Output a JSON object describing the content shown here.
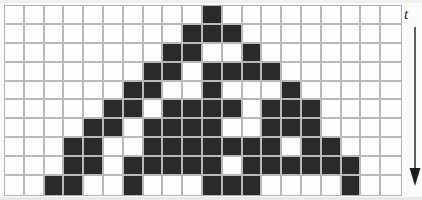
{
  "figure": {
    "kind": "cellular-automaton-spacetime-diagram",
    "background_color": "#fbfbfb",
    "grid_line_color": "#b9b9b9",
    "alive_cell_color": "#2a2a2a",
    "dead_cell_color": "#fdfdfd"
  },
  "axis": {
    "time_label": "t",
    "arrow_icon": "down-arrow-icon",
    "direction": "downward"
  },
  "chart_data": {
    "type": "heatmap",
    "title": "",
    "xlabel": "",
    "ylabel": "t",
    "columns": 20,
    "rows": 10,
    "legend": [
      {
        "value": 1,
        "label": "alive",
        "color": "#2a2a2a"
      },
      {
        "value": 0,
        "label": "dead",
        "color": "#fdfdfd"
      }
    ],
    "row_labels": [
      "0",
      "1",
      "2",
      "3",
      "4",
      "5",
      "6",
      "7",
      "8",
      "9"
    ],
    "column_labels": [
      "0",
      "1",
      "2",
      "3",
      "4",
      "5",
      "6",
      "7",
      "8",
      "9",
      "10",
      "11",
      "12",
      "13",
      "14",
      "15",
      "16",
      "17",
      "18",
      "19"
    ],
    "matrix": [
      [
        0,
        0,
        0,
        0,
        0,
        0,
        0,
        0,
        0,
        0,
        1,
        0,
        0,
        0,
        0,
        0,
        0,
        0,
        0,
        0
      ],
      [
        0,
        0,
        0,
        0,
        0,
        0,
        0,
        0,
        0,
        1,
        1,
        1,
        0,
        0,
        0,
        0,
        0,
        0,
        0,
        0
      ],
      [
        0,
        0,
        0,
        0,
        0,
        0,
        0,
        0,
        1,
        1,
        0,
        0,
        1,
        0,
        0,
        0,
        0,
        0,
        0,
        0
      ],
      [
        0,
        0,
        0,
        0,
        0,
        0,
        0,
        1,
        1,
        0,
        1,
        1,
        1,
        1,
        0,
        0,
        0,
        0,
        0,
        0
      ],
      [
        0,
        0,
        0,
        0,
        0,
        0,
        1,
        1,
        0,
        0,
        1,
        0,
        0,
        0,
        1,
        0,
        0,
        0,
        0,
        0
      ],
      [
        0,
        0,
        0,
        0,
        0,
        1,
        1,
        0,
        1,
        1,
        1,
        1,
        0,
        1,
        1,
        1,
        0,
        0,
        0,
        0
      ],
      [
        0,
        0,
        0,
        0,
        1,
        1,
        0,
        1,
        1,
        1,
        1,
        0,
        0,
        1,
        1,
        1,
        0,
        0,
        0,
        0
      ],
      [
        0,
        0,
        0,
        1,
        1,
        0,
        0,
        1,
        1,
        1,
        1,
        1,
        1,
        1,
        0,
        1,
        1,
        0,
        0,
        0
      ],
      [
        0,
        0,
        0,
        1,
        1,
        0,
        1,
        1,
        1,
        1,
        1,
        0,
        1,
        1,
        1,
        1,
        1,
        1,
        0,
        0
      ],
      [
        0,
        0,
        1,
        1,
        0,
        0,
        1,
        0,
        0,
        0,
        1,
        1,
        1,
        0,
        0,
        0,
        0,
        1,
        0,
        0
      ]
    ]
  }
}
